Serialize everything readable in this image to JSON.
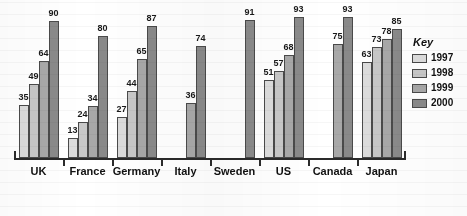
{
  "chart_data": {
    "type": "bar",
    "title": "",
    "xlabel": "",
    "ylabel": "",
    "ylim": [
      0,
      100
    ],
    "grid": false,
    "legend_position": "right",
    "categories": [
      "UK",
      "France",
      "Germany",
      "Italy",
      "Sweden",
      "US",
      "Canada",
      "Japan"
    ],
    "series": [
      {
        "name": "1997",
        "color": "#dcdcdc",
        "values": [
          35,
          13,
          27,
          null,
          null,
          51,
          null,
          63
        ]
      },
      {
        "name": "1998",
        "color": "#c8c8c8",
        "values": [
          49,
          24,
          44,
          null,
          null,
          57,
          null,
          73
        ]
      },
      {
        "name": "1999",
        "color": "#a8a8a8",
        "values": [
          64,
          34,
          65,
          36,
          null,
          68,
          75,
          78
        ]
      },
      {
        "name": "2000",
        "color": "#8a8a8a",
        "values": [
          90,
          80,
          87,
          74,
          91,
          93,
          93,
          85
        ]
      }
    ]
  },
  "legend": {
    "title": "Key",
    "items": [
      {
        "label": "1997"
      },
      {
        "label": "1998"
      },
      {
        "label": "1999"
      },
      {
        "label": "2000"
      }
    ]
  },
  "axis": {
    "labels": [
      "UK",
      "France",
      "Germany",
      "Italy",
      "Sweden",
      "US",
      "Canada",
      "Japan"
    ]
  },
  "colors": {
    "series_1997": "#dcdcdc",
    "series_1998": "#c8c8c8",
    "series_1999": "#a8a8a8",
    "series_2000": "#8a8a8a",
    "axis": "#2b2b2b",
    "bar_outline": "#4a4a4a",
    "text": "#111111",
    "background": "#ffffff"
  }
}
